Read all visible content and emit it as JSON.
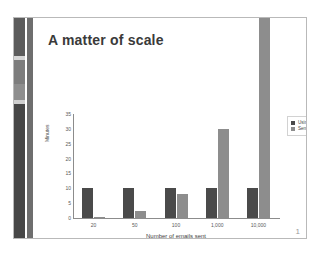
{
  "slide": {
    "title": "A matter of scale",
    "page_number": "1"
  },
  "legend": {
    "position": "right",
    "entries": [
      {
        "label": "Using a service",
        "color": "#4a4a4a"
      },
      {
        "label": "Sent locally",
        "color": "#8d8d8d"
      }
    ]
  },
  "chart_data": {
    "type": "bar",
    "title": "A matter of scale",
    "xlabel": "Number of emails sent",
    "ylabel": "Minutes",
    "categories": [
      "20",
      "50",
      "100",
      "1,000",
      "10,000"
    ],
    "series": [
      {
        "name": "Using a service",
        "color": "#4a4a4a",
        "values": [
          10,
          10,
          10,
          10,
          10
        ]
      },
      {
        "name": "Sent locally",
        "color": "#8d8d8d",
        "values": [
          0.5,
          2.5,
          8,
          30,
          100
        ]
      }
    ],
    "ylim": [
      0,
      35
    ],
    "yticks": [
      "0",
      "5",
      "10",
      "15",
      "20",
      "25",
      "30",
      "35"
    ],
    "grid": false,
    "legend_position": "right"
  },
  "colors": {
    "series_dark": "#4a4a4a",
    "series_light": "#8d8d8d",
    "sidebar_dark": "#474747",
    "axis": "#8c8c8c"
  }
}
